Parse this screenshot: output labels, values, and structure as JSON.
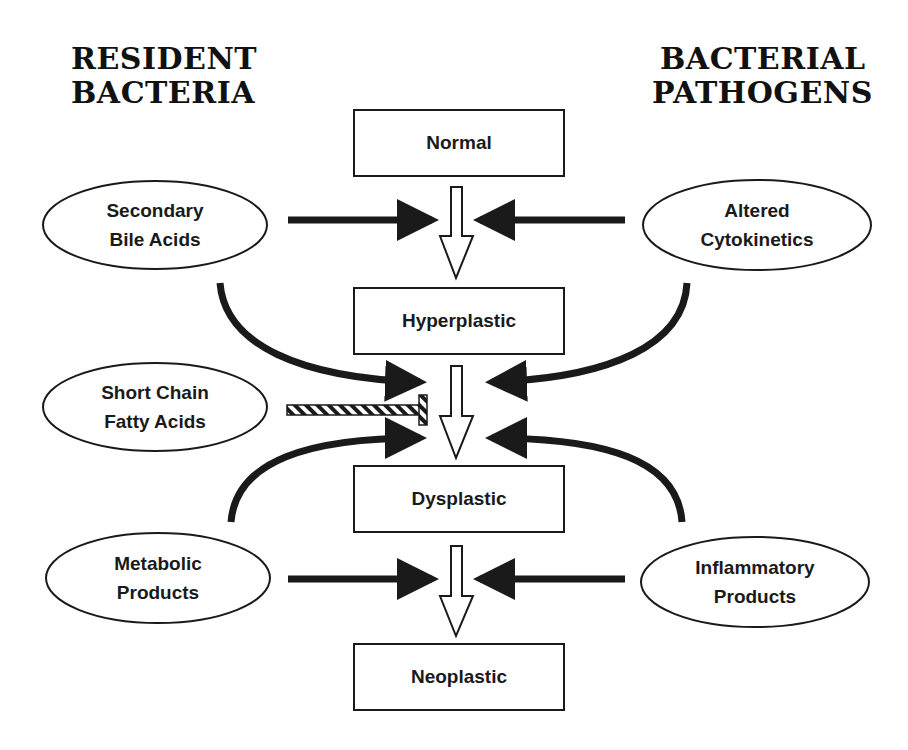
{
  "headers": {
    "left": [
      "RESIDENT",
      "BACTERIA"
    ],
    "right": [
      "BACTERIAL",
      "PATHOGENS"
    ]
  },
  "stages": [
    {
      "label": "Normal"
    },
    {
      "label": "Hyperplastic"
    },
    {
      "label": "Dysplastic"
    },
    {
      "label": "Neoplastic"
    }
  ],
  "left_factors": [
    {
      "line1": "Secondary",
      "line2": "Bile Acids",
      "effect": "promotes"
    },
    {
      "line1": "Short Chain",
      "line2": "Fatty Acids",
      "effect": "inhibits"
    },
    {
      "line1": "Metabolic",
      "line2": "Products",
      "effect": "promotes"
    }
  ],
  "right_factors": [
    {
      "line1": "Altered",
      "line2": "Cytokinetics",
      "effect": "promotes"
    },
    {
      "line1": "Inflammatory",
      "line2": "Products",
      "effect": "promotes"
    }
  ],
  "colors": {
    "stroke": "#1a1a1a",
    "background": "#ffffff"
  }
}
